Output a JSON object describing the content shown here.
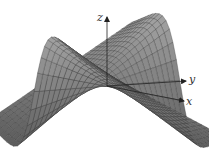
{
  "figure": {
    "type": "3d-surface",
    "surface_color": "#8a8a8a",
    "mesh_color": "#3a3a3a",
    "background": "#ffffff"
  },
  "axes": {
    "z": {
      "label": "z"
    },
    "y": {
      "label": "y"
    },
    "x": {
      "label": "x"
    }
  },
  "chart_data": {
    "type": "surface",
    "title": "",
    "xlabel": "x",
    "ylabel": "y",
    "zlabel": "z",
    "grid": false
  }
}
